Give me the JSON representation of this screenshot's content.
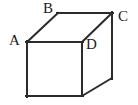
{
  "figure": {
    "name": "labeled-cube-diagram",
    "background_color": "#ffffff",
    "stroke_color": "#2b2b2b",
    "stroke_width": 2,
    "width": 138,
    "height": 105,
    "labels": [
      {
        "id": "A",
        "text": "A",
        "x": 9,
        "y": 33,
        "vertex": "front-top-left"
      },
      {
        "id": "B",
        "text": "B",
        "x": 43,
        "y": 1,
        "vertex": "back-top-left"
      },
      {
        "id": "C",
        "text": "C",
        "x": 118,
        "y": 9,
        "vertex": "back-top-right"
      },
      {
        "id": "D",
        "text": "D",
        "x": 86,
        "y": 37,
        "vertex": "front-top-right"
      }
    ],
    "vertices": {
      "front_top_left": [
        27,
        42
      ],
      "front_top_right": [
        82,
        42
      ],
      "front_bottom_right": [
        82,
        96
      ],
      "front_bottom_left": [
        27,
        96
      ],
      "back_top_left": [
        58,
        13
      ],
      "back_top_right": [
        112,
        13
      ],
      "back_bottom_right": [
        112,
        78
      ]
    },
    "edges": [
      {
        "name": "front-face-top",
        "from": [
          27,
          42
        ],
        "to": [
          82,
          42
        ]
      },
      {
        "name": "front-face-right",
        "from": [
          82,
          42
        ],
        "to": [
          82,
          96
        ]
      },
      {
        "name": "front-face-bottom",
        "from": [
          82,
          96
        ],
        "to": [
          27,
          96
        ]
      },
      {
        "name": "front-face-left",
        "from": [
          27,
          96
        ],
        "to": [
          27,
          42
        ]
      },
      {
        "name": "top-left-diagonal",
        "from": [
          27,
          42
        ],
        "to": [
          58,
          13
        ]
      },
      {
        "name": "top-back-edge",
        "from": [
          58,
          13
        ],
        "to": [
          112,
          13
        ]
      },
      {
        "name": "top-right-diagonal",
        "from": [
          82,
          42
        ],
        "to": [
          112,
          13
        ]
      },
      {
        "name": "back-right-vertical",
        "from": [
          112,
          13
        ],
        "to": [
          112,
          78
        ]
      },
      {
        "name": "bottom-right-diagonal",
        "from": [
          82,
          96
        ],
        "to": [
          112,
          78
        ]
      }
    ]
  }
}
